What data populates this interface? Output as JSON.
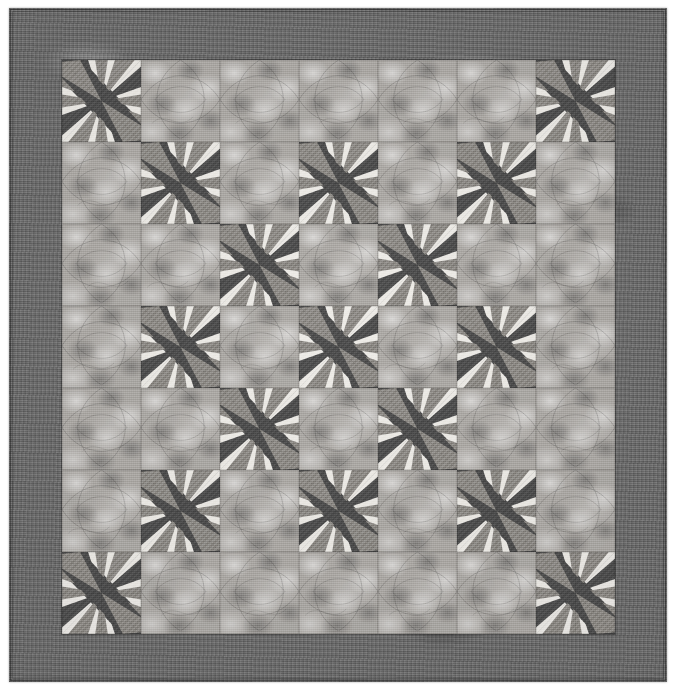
{
  "image": {
    "subject": "patchwork quilt",
    "view": "flat full-front photograph",
    "palette": "monochrome grayscale"
  },
  "quilt": {
    "title": "Pieced star quilt",
    "colors": {
      "outer_border": "#6d6d6d",
      "background_print": "#adaaa6",
      "star_dark": "#4f4f4f",
      "star_medium": "#8e8b86",
      "star_light": "#e6e4df",
      "star_medium_print": "#a5a29d",
      "page_background": "#ffffff"
    },
    "layout": {
      "grid_rows": 7,
      "grid_cols": 7,
      "block_label": "star block",
      "alternate_block_label": "print square",
      "border_label": "mottled outer border",
      "binding_label": "narrow binding"
    },
    "block_grid": [
      [
        "star",
        "print",
        "print",
        "print",
        "print",
        "print",
        "star"
      ],
      [
        "print",
        "star",
        "print",
        "star",
        "print",
        "star",
        "print"
      ],
      [
        "print",
        "print",
        "star",
        "print",
        "star",
        "print",
        "print"
      ],
      [
        "print",
        "star",
        "print",
        "star",
        "print",
        "star",
        "print"
      ],
      [
        "print",
        "print",
        "star",
        "print",
        "star",
        "print",
        "print"
      ],
      [
        "print",
        "star",
        "print",
        "star",
        "print",
        "star",
        "print"
      ],
      [
        "star",
        "print",
        "print",
        "print",
        "print",
        "print",
        "star"
      ]
    ],
    "star_block": {
      "description": "eight-point pinwheel star with dark and medium points on light ground",
      "points_dark": 4,
      "points_medium": 4,
      "corner_units": 4
    }
  }
}
